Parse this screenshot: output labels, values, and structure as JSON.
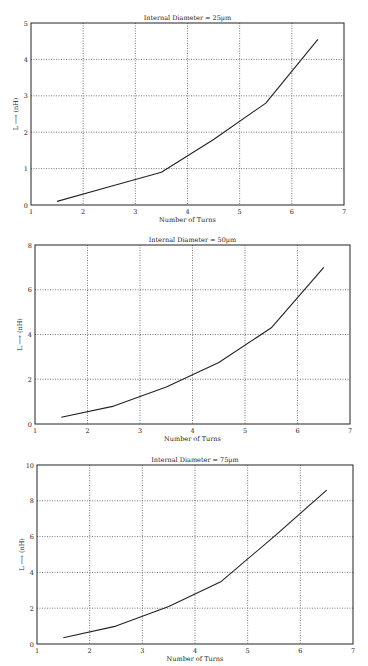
{
  "chart_data": [
    {
      "type": "line",
      "title": "Internal Diameter = 25µm",
      "xlabel": "Number of Turns",
      "ylabel": "L ⟶ (nH)",
      "x": [
        1.5,
        2.5,
        3.5,
        4.5,
        5.5,
        6.5
      ],
      "values": [
        0.1,
        0.5,
        0.9,
        1.8,
        2.8,
        4.55
      ],
      "xlim": [
        1,
        7
      ],
      "ylim": [
        0,
        5
      ],
      "xticks": [
        1,
        2,
        3,
        4,
        5,
        6,
        7
      ],
      "yticks": [
        0,
        1,
        2,
        3,
        4,
        5
      ],
      "grid": true,
      "frame": {
        "left": 31,
        "right": 344,
        "top": 23,
        "bottom": 205
      }
    },
    {
      "type": "line",
      "title": "Internal Diameter = 50µm",
      "xlabel": "Number of Turns",
      "ylabel": "L ⟶ (nH)",
      "x": [
        1.5,
        2.5,
        3.5,
        4.5,
        5.5,
        6.5
      ],
      "values": [
        0.3,
        0.8,
        1.65,
        2.75,
        4.3,
        7.0
      ],
      "xlim": [
        1,
        7
      ],
      "ylim": [
        0,
        8
      ],
      "xticks": [
        1,
        2,
        3,
        4,
        5,
        6,
        7
      ],
      "yticks": [
        0,
        2,
        4,
        6,
        8
      ],
      "grid": true,
      "frame": {
        "left": 35,
        "right": 350,
        "top": 245,
        "bottom": 424
      }
    },
    {
      "type": "line",
      "title": "Internal Diameter = 75µm",
      "xlabel": "Number of Turns",
      "ylabel": "L ⟶ (nH)",
      "x": [
        1.5,
        2.5,
        3.5,
        4.5,
        5.5,
        6.5
      ],
      "values": [
        0.35,
        1.0,
        2.1,
        3.5,
        6.0,
        8.6
      ],
      "xlim": [
        1,
        7
      ],
      "ylim": [
        0,
        10
      ],
      "xticks": [
        1,
        2,
        3,
        4,
        5,
        6,
        7
      ],
      "yticks": [
        0,
        2,
        4,
        6,
        8,
        10
      ],
      "grid": true,
      "frame": {
        "left": 37,
        "right": 353,
        "top": 465,
        "bottom": 644
      }
    }
  ],
  "colors": {
    "line": "#222222",
    "grid": "#555555",
    "frame": "#222222"
  }
}
